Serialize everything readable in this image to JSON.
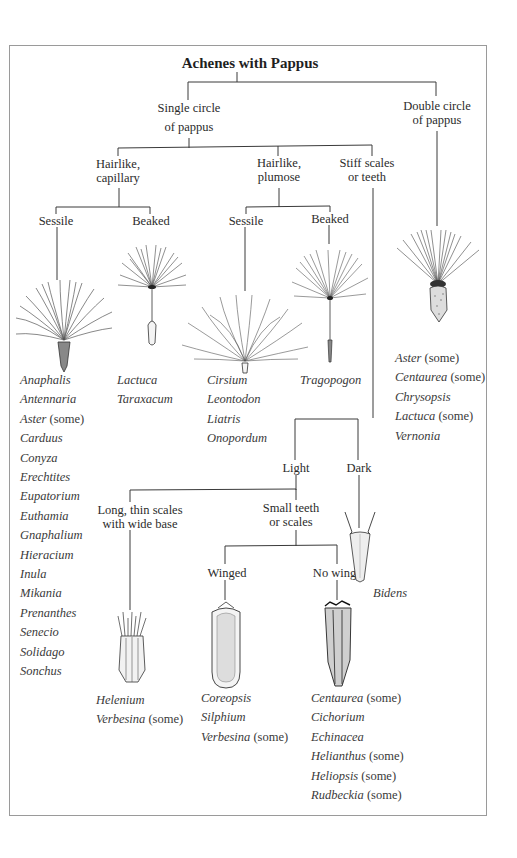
{
  "title": "Achenes with Pappus",
  "branches": {
    "single": {
      "line1": "Single circle",
      "line2": "of pappus"
    },
    "double": {
      "line1": "Double circle",
      "line2": "of pappus"
    },
    "capillary": {
      "line1": "Hairlike,",
      "line2": "capillary"
    },
    "plumose": {
      "line1": "Hairlike,",
      "line2": "plumose"
    },
    "stiff": {
      "line1": "Stiff scales",
      "line2": "or teeth"
    },
    "cap_sessile": "Sessile",
    "cap_beaked": "Beaked",
    "plu_sessile": "Sessile",
    "plu_beaked": "Beaked",
    "light": "Light",
    "dark": "Dark",
    "long_thin": {
      "line1": "Long, thin scales",
      "line2": "with wide base"
    },
    "small_teeth": {
      "line1": "Small teeth",
      "line2": "or scales"
    },
    "winged": "Winged",
    "no_wings": "No wings"
  },
  "lists": {
    "capillary_sessile": [
      {
        "genus": "Anaphalis",
        "note": ""
      },
      {
        "genus": "Antennaria",
        "note": ""
      },
      {
        "genus": "Aster",
        "note": "(some)"
      },
      {
        "genus": "Carduus",
        "note": ""
      },
      {
        "genus": "Conyza",
        "note": ""
      },
      {
        "genus": "Erechtites",
        "note": ""
      },
      {
        "genus": "Eupatorium",
        "note": ""
      },
      {
        "genus": "Euthamia",
        "note": ""
      },
      {
        "genus": "Gnaphalium",
        "note": ""
      },
      {
        "genus": "Hieracium",
        "note": ""
      },
      {
        "genus": "Inula",
        "note": ""
      },
      {
        "genus": "Mikania",
        "note": ""
      },
      {
        "genus": "Prenanthes",
        "note": ""
      },
      {
        "genus": "Senecio",
        "note": ""
      },
      {
        "genus": "Solidago",
        "note": ""
      },
      {
        "genus": "Sonchus",
        "note": ""
      }
    ],
    "capillary_beaked": [
      {
        "genus": "Lactuca",
        "note": ""
      },
      {
        "genus": "Taraxacum",
        "note": ""
      }
    ],
    "plumose_sessile": [
      {
        "genus": "Cirsium",
        "note": ""
      },
      {
        "genus": "Leontodon",
        "note": ""
      },
      {
        "genus": "Liatris",
        "note": ""
      },
      {
        "genus": "Onopordum",
        "note": ""
      }
    ],
    "plumose_beaked": [
      {
        "genus": "Tragopogon",
        "note": ""
      }
    ],
    "double": [
      {
        "genus": "Aster",
        "note": "(some)"
      },
      {
        "genus": "Centaurea",
        "note": "(some)"
      },
      {
        "genus": "Chrysopsis",
        "note": ""
      },
      {
        "genus": "Lactuca",
        "note": "(some)"
      },
      {
        "genus": "Vernonia",
        "note": ""
      }
    ],
    "dark": [
      {
        "genus": "Bidens",
        "note": ""
      }
    ],
    "long_thin": [
      {
        "genus": "Helenium",
        "note": ""
      },
      {
        "genus": "Verbesina",
        "note": "(some)"
      }
    ],
    "winged": [
      {
        "genus": "Coreopsis",
        "note": ""
      },
      {
        "genus": "Silphium",
        "note": ""
      },
      {
        "genus": "Verbesina",
        "note": "(some)"
      }
    ],
    "no_wings": [
      {
        "genus": "Centaurea",
        "note": "(some)"
      },
      {
        "genus": "Cichorium",
        "note": ""
      },
      {
        "genus": "Echinacea",
        "note": ""
      },
      {
        "genus": "Helianthus",
        "note": "(some)"
      },
      {
        "genus": "Heliopsis",
        "note": "(some)"
      },
      {
        "genus": "Rudbeckia",
        "note": "(some)"
      }
    ]
  },
  "drawings": {
    "capillary_sessile": "achene-capillary-sessile-illustration",
    "capillary_beaked": "achene-capillary-beaked-illustration",
    "plumose_sessile": "achene-plumose-sessile-illustration",
    "plumose_beaked": "achene-plumose-beaked-illustration",
    "double": "achene-double-pappus-illustration",
    "dark": "achene-dark-bidens-illustration",
    "long_thin": "achene-long-thin-scales-illustration",
    "winged": "achene-winged-illustration",
    "no_wings": "achene-no-wings-illustration"
  }
}
